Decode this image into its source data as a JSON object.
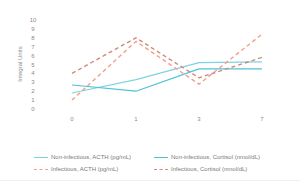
{
  "chart_data": {
    "type": "line",
    "title": "",
    "xlabel": "",
    "ylabel": "Integral Units",
    "x": [
      "0",
      "1",
      "3",
      "7"
    ],
    "yticks": [
      "0",
      "1",
      "2",
      "3",
      "4",
      "5",
      "6",
      "7",
      "8",
      "9",
      "10"
    ],
    "ylim": [
      0,
      10
    ],
    "grid": false,
    "legend_position": "bottom",
    "series": [
      {
        "name": "Non-infectious, ACTH (pg/mL)",
        "values": [
          1.8,
          3.3,
          5.2,
          5.3
        ],
        "color": "#7fd3e0",
        "style": "solid"
      },
      {
        "name": "Non-infectious, Cortisol (nmol/dL)",
        "values": [
          2.7,
          2.0,
          4.5,
          4.5
        ],
        "color": "#4fc3d6",
        "style": "solid"
      },
      {
        "name": "Infectious, ACTH (pg/mL)",
        "values": [
          1.0,
          7.6,
          2.8,
          8.4
        ],
        "color": "#f0a08a",
        "style": "dashed"
      },
      {
        "name": "Infectious, Cortisol (nmol/dL)",
        "values": [
          4.0,
          8.0,
          3.5,
          5.8
        ],
        "color": "#d08a78",
        "style": "dashed"
      }
    ]
  }
}
